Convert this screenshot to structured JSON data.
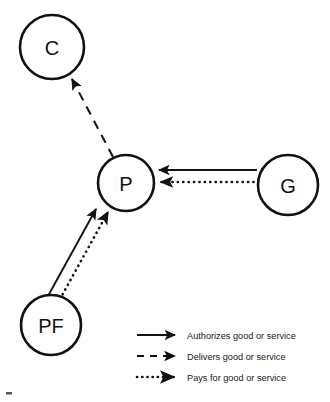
{
  "diagram": {
    "background_color": "#ffffff",
    "line_color": "#111111",
    "nodes": [
      {
        "id": "C",
        "label": "C",
        "name": "consumer",
        "cx": 52,
        "cy": 47,
        "r": 32
      },
      {
        "id": "P",
        "label": "P",
        "name": "provider",
        "cx": 126,
        "cy": 183,
        "r": 28
      },
      {
        "id": "G",
        "label": "G",
        "name": "government",
        "cx": 288,
        "cy": 185,
        "r": 30
      },
      {
        "id": "PF",
        "label": "PF",
        "name": "payer-financier",
        "cx": 51,
        "cy": 325,
        "r": 30
      }
    ],
    "edges": [
      {
        "name": "edge-provider-to-consumer-delivers",
        "from": "P",
        "to": "C",
        "style": "dashed",
        "meaning": "Delivers good or service"
      },
      {
        "name": "edge-government-to-provider-authorizes",
        "from": "G",
        "to": "P",
        "style": "solid",
        "meaning": "Authorizes good or service"
      },
      {
        "name": "edge-government-to-provider-pays",
        "from": "G",
        "to": "P",
        "style": "dotted",
        "meaning": "Pays for good or service"
      },
      {
        "name": "edge-payer-to-provider-authorizes",
        "from": "PF",
        "to": "P",
        "style": "solid",
        "meaning": "Authorizes good or service"
      },
      {
        "name": "edge-payer-to-provider-pays",
        "from": "PF",
        "to": "P",
        "style": "dotted",
        "meaning": "Pays for good or service"
      }
    ]
  },
  "legend": {
    "items": [
      {
        "style": "solid",
        "label": "Authorizes good or service"
      },
      {
        "style": "dashed",
        "label": "Delivers good or service"
      },
      {
        "style": "dotted",
        "label": "Pays for good or service"
      }
    ]
  }
}
